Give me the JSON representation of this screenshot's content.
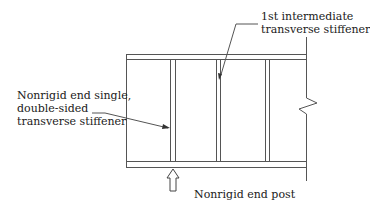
{
  "diagram": {
    "type": "plate-girder-elevation",
    "labels": {
      "first_intermediate": [
        "1st intermediate",
        "transverse stiffener"
      ],
      "end_stiffener": [
        "Nonrigid end single,",
        "double-sided",
        "transverse stiffener"
      ],
      "end_post": "Nonrigid end post"
    },
    "colors": {
      "line": "#555555",
      "text": "#1a1a1a",
      "background": "#ffffff"
    }
  }
}
